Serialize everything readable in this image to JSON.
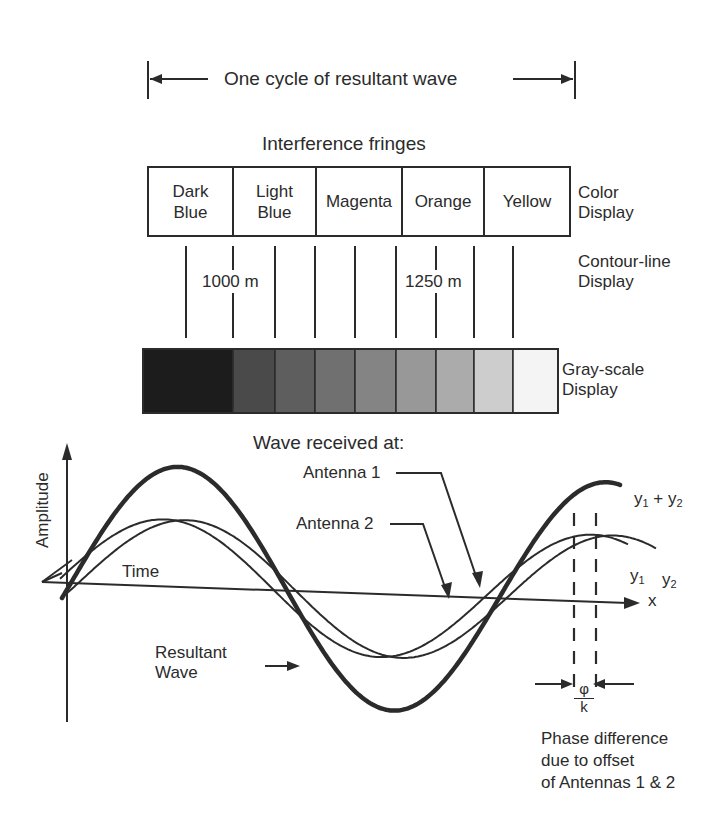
{
  "cycle_span": {
    "label": "One cycle of resultant wave",
    "x_start": 148,
    "x_end": 575,
    "y": 79
  },
  "fringes": {
    "title": "Interference fringes",
    "color_display": {
      "label_line1": "Color",
      "label_line2": "Display",
      "cells": [
        {
          "label": "Dark\nBlue",
          "x0": 148,
          "x1": 233
        },
        {
          "label": "Light\nBlue",
          "x0": 233,
          "x1": 316
        },
        {
          "label": "Magenta",
          "x0": 316,
          "x1": 402
        },
        {
          "label": "Orange",
          "x0": 402,
          "x1": 484
        },
        {
          "label": "Yellow",
          "x0": 484,
          "x1": 570
        }
      ]
    },
    "contour_display": {
      "label_line1": "Contour-line",
      "label_line2": "Display",
      "lines_x": [
        186,
        233,
        275,
        315,
        355,
        396,
        436,
        474,
        513
      ],
      "labels": [
        {
          "text": "1000 m",
          "x": 233
        },
        {
          "text": "1250 m",
          "x": 436
        }
      ]
    },
    "grayscale_display": {
      "label_line1": "Gray-scale",
      "label_line2": "Display",
      "bands": [
        {
          "x0": 143,
          "x1": 233,
          "shade": "#1c1c1c"
        },
        {
          "x0": 233,
          "x1": 275,
          "shade": "#4a4a4a"
        },
        {
          "x0": 275,
          "x1": 315,
          "shade": "#5e5e5e"
        },
        {
          "x0": 315,
          "x1": 355,
          "shade": "#707070"
        },
        {
          "x0": 355,
          "x1": 396,
          "shade": "#848484"
        },
        {
          "x0": 396,
          "x1": 436,
          "shade": "#989898"
        },
        {
          "x0": 436,
          "x1": 474,
          "shade": "#ababab"
        },
        {
          "x0": 474,
          "x1": 513,
          "shade": "#cdcdcd"
        },
        {
          "x0": 513,
          "x1": 558,
          "shade": "#f4f4f4"
        }
      ]
    }
  },
  "wave_plot": {
    "title": "Wave received at:",
    "y_axis_label": "Amplitude",
    "time_label": "Time",
    "x_axis_label": "x",
    "antenna1_label": "Antenna 1",
    "antenna2_label": "Antenna 2",
    "resultant_label_line1": "Resultant",
    "resultant_label_line2": "Wave",
    "sum_label": {
      "base1": "y",
      "sub1": "1",
      "op": " + ",
      "base2": "y",
      "sub2": "2"
    },
    "y1_label": {
      "base": "y",
      "sub": "1"
    },
    "y2_label": {
      "base": "y",
      "sub": "2"
    },
    "phase_numerator": "φ",
    "phase_denominator": "k",
    "phase_caption_line1": "Phase difference",
    "phase_caption_line2": "due to offset",
    "phase_caption_line3": "of Antennas 1 & 2"
  },
  "chart_data": {
    "type": "line",
    "title": "Wave received at:",
    "xlabel": "x (Time)",
    "ylabel": "Amplitude",
    "series": [
      {
        "name": "Antenna 1 (y1)",
        "amplitude": 1.0,
        "phase_offset": 0,
        "stroke": "thin"
      },
      {
        "name": "Antenna 2 (y2)",
        "amplitude": 1.0,
        "phase_offset": "φ/k",
        "stroke": "thin"
      },
      {
        "name": "Resultant wave (y1 + y2)",
        "amplitude": 1.9,
        "phase_offset": "φ/(2k)",
        "stroke": "thick"
      }
    ],
    "annotations": [
      "One cycle of resultant wave",
      "Phase difference due to offset of Antennas 1 & 2"
    ]
  }
}
